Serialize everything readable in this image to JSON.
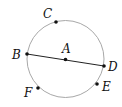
{
  "diagram": {
    "type": "circle-with-diameter",
    "colors": {
      "circle": "#a8a8a8",
      "segment": "#222222",
      "point": "#111111",
      "label": "#111111",
      "background": "#ffffff"
    },
    "circle": {
      "cx": 65.5,
      "cy": 59,
      "r": 38.5
    },
    "segment": {
      "from": "B",
      "to": "D",
      "label": "BD"
    },
    "points": [
      {
        "name": "A",
        "x": 65.5,
        "y": 59.5,
        "label_x": 62,
        "label_y": 53
      },
      {
        "name": "B",
        "x": 27,
        "y": 54,
        "label_x": 12,
        "label_y": 59
      },
      {
        "name": "C",
        "x": 56,
        "y": 22,
        "label_x": 43,
        "label_y": 18
      },
      {
        "name": "D",
        "x": 104,
        "y": 66,
        "label_x": 108,
        "label_y": 71
      },
      {
        "name": "E",
        "x": 97,
        "y": 84,
        "label_x": 102,
        "label_y": 91
      },
      {
        "name": "F",
        "x": 38,
        "y": 88,
        "label_x": 24,
        "label_y": 97
      }
    ]
  }
}
